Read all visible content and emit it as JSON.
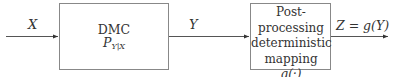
{
  "diagram": {
    "input_signal": "X",
    "channel": {
      "title": "DMC",
      "expr_base": "P",
      "expr_sub": "Y|X"
    },
    "intermediate_signal": "Y",
    "postproc": {
      "line1": "Post-processing",
      "line2": "deterministic",
      "line3": "mapping",
      "line4": "g(·)"
    },
    "output_signal": "Z = g(Y)"
  }
}
